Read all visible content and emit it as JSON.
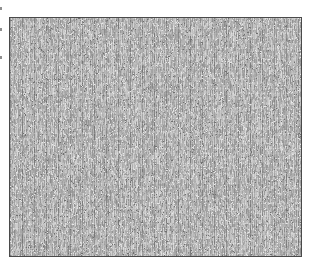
{
  "image": {
    "alt": "gray woven fabric texture swatch",
    "background_color": "#ffffff",
    "frame_border_color": "#4a4a4a",
    "texture": {
      "base_color": "#b2b2b2",
      "light_color": "#e8e8e8",
      "dark_color": "#6f6f6f",
      "speck_light_color": "#e9e9e9",
      "speck_dark_color": "#707070",
      "stripe_period_px": 12,
      "weft_period_px": 5,
      "seed": 42
    }
  },
  "edge_fragments": {
    "color": "#8f8f8f",
    "positions_y": [
      7,
      28,
      56
    ]
  }
}
